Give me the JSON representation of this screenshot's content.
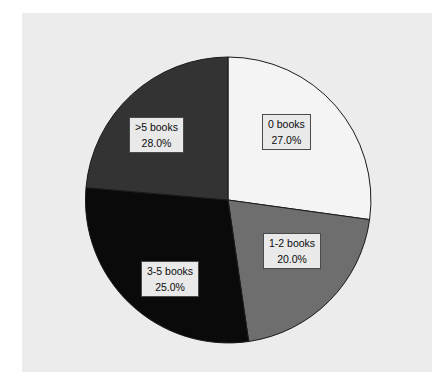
{
  "figure": {
    "background_color": "#ffffff",
    "plot_background_color": "#ececec"
  },
  "chart_data": {
    "type": "pie",
    "title": "",
    "xlabel": "",
    "ylabel": "",
    "categories": [
      "0 books",
      "1-2 books",
      "3-5 books",
      ">5 books"
    ],
    "values": [
      27.0,
      20.0,
      25.0,
      28.0
    ],
    "value_labels": [
      "27.0%",
      "20.0%",
      "25.0%",
      "28.0%"
    ],
    "colors": [
      "#f4f4f4",
      "#6e6e6e",
      "#0a0a0a",
      "#333333"
    ],
    "start_angle_deg": 90,
    "direction": "clockwise",
    "legend": "none",
    "grid": false,
    "wedge_edge_color": "#1a1a1a",
    "label_box_fill": "#e9e9e9",
    "label_box_border": "#4a4a4a",
    "label_text_color": "#0b0b0b"
  },
  "wedges": [
    {
      "id": "0books",
      "name": "0 books",
      "percent": "27.0%",
      "color": "#f4f4f4",
      "path": "M 228 200 L 228 57 A 143 143 0 0 1 369.6 219.6 Z"
    },
    {
      "id": "12books",
      "name": "1-2 books",
      "percent": "20.0%",
      "color": "#6e6e6e",
      "path": "M 228 200 L 369.6 219.6 A 143 143 0 0 1 248.7 341.5 Z"
    },
    {
      "id": "35books",
      "name": "3-5 books",
      "percent": "25.0%",
      "color": "#0a0a0a",
      "path": "M 228 200 L 248.7 341.5 A 143 143 0 0 1 86.0 187.6 Z"
    },
    {
      "id": "5books",
      "name": ">5 books",
      "percent": "28.0%",
      "color": "#333333",
      "path": "M 228 200 L 86.0 187.6 A 143 143 0 0 1 228 57 Z"
    }
  ]
}
